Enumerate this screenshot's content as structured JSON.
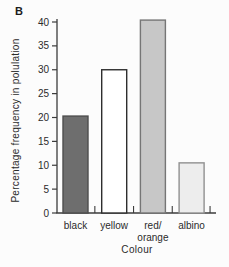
{
  "figure_label": "B",
  "chart_data": {
    "type": "bar",
    "title": "",
    "categories": [
      "black",
      "yellow",
      "red/orange",
      "albino"
    ],
    "category_label_lines": [
      [
        "black"
      ],
      [
        "yellow"
      ],
      [
        "red/",
        "orange"
      ],
      [
        "albino"
      ]
    ],
    "values": [
      20.3,
      30,
      40.4,
      10.5
    ],
    "xlabel": "Colour",
    "ylabel": "Percentage frequency in polulation",
    "ylim": [
      0,
      40
    ],
    "yticks": [
      0,
      5,
      10,
      15,
      20,
      25,
      30,
      35,
      40
    ],
    "grid": false,
    "legend": false,
    "bar_colors": [
      "#6e6e6e",
      "#ffffff",
      "#c7c7c7",
      "#ededed"
    ],
    "bar_borders": [
      "#4d4d4d",
      "#2e2e2e",
      "#767676",
      "#909090"
    ],
    "colors": {
      "axis": "#3c3c3c",
      "text": "#2b2b2b",
      "background": "#fcfcfc"
    }
  }
}
